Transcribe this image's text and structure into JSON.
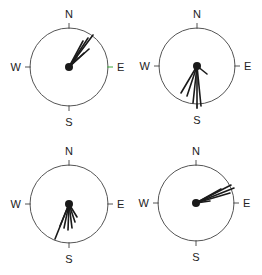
{
  "figure": {
    "line_color": "#1a1a1a",
    "circle_color": "#555555",
    "accent_tick_color": "#3aa63a"
  },
  "compasses": [
    {
      "id": "top-left",
      "cx": 69,
      "cy": 67,
      "r": 39,
      "labels": {
        "n": "N",
        "s": "S",
        "e": "E",
        "w": "W"
      },
      "dominant_direction": "NNE",
      "e_tick_color": "#3aa63a",
      "rays": [
        [
          24,
          -32
        ],
        [
          19,
          -29
        ],
        [
          14,
          -26
        ],
        [
          20,
          -18
        ],
        [
          15,
          -14
        ],
        [
          8,
          -10
        ]
      ]
    },
    {
      "id": "top-right",
      "cx": 197,
      "cy": 66,
      "r": 38,
      "labels": {
        "n": "N",
        "s": "S",
        "e": "E",
        "w": "W"
      },
      "dominant_direction": "S",
      "rays": [
        [
          -16,
          27
        ],
        [
          -10,
          30
        ],
        [
          -4,
          37
        ],
        [
          0,
          42
        ],
        [
          4,
          40
        ],
        [
          10,
          8
        ]
      ]
    },
    {
      "id": "bottom-left",
      "cx": 69,
      "cy": 204,
      "r": 39,
      "labels": {
        "n": "N",
        "s": "S",
        "e": "E",
        "w": "W"
      },
      "dominant_direction": "SSW",
      "rays": [
        [
          -14,
          35
        ],
        [
          -9,
          22
        ],
        [
          -5,
          24
        ],
        [
          -1,
          26
        ],
        [
          3,
          24
        ],
        [
          6,
          18
        ],
        [
          8,
          13
        ]
      ]
    },
    {
      "id": "bottom-right",
      "cx": 196,
      "cy": 203,
      "r": 38,
      "labels": {
        "n": "N",
        "s": "S",
        "e": "E",
        "w": "W"
      },
      "dominant_direction": "ENE",
      "rays": [
        [
          35,
          -18
        ],
        [
          38,
          -15
        ],
        [
          34,
          -10
        ],
        [
          25,
          -14
        ],
        [
          14,
          -2
        ]
      ]
    }
  ]
}
